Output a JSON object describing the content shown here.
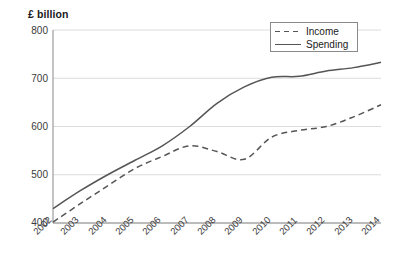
{
  "chart_data": {
    "type": "line",
    "title": "",
    "subtitle": "",
    "ylabel": "£ billion",
    "xlabel": "",
    "ylim": [
      400,
      800
    ],
    "yticks": [
      400,
      500,
      600,
      700,
      800
    ],
    "grid": true,
    "legend_position": "top-right",
    "categories": [
      "2002",
      "2003",
      "2004",
      "2005",
      "2006",
      "2007",
      "2008",
      "2009",
      "2010",
      "2011",
      "2012",
      "2013",
      "2014"
    ],
    "series": [
      {
        "name": "Income",
        "style": "dashed",
        "color": "#555555",
        "values": [
          402,
          440,
          477,
          513,
          538,
          560,
          548,
          532,
          578,
          592,
          600,
          620,
          645
        ]
      },
      {
        "name": "Spending",
        "style": "solid",
        "color": "#555555",
        "values": [
          430,
          467,
          500,
          530,
          560,
          600,
          648,
          682,
          702,
          704,
          715,
          722,
          733
        ]
      }
    ]
  },
  "axis": {
    "y_title": "£ billion",
    "y_tick_labels": [
      "800",
      "700",
      "600",
      "500",
      "400"
    ],
    "x_tick_labels": [
      "2002",
      "2003",
      "2004",
      "2005",
      "2006",
      "2007",
      "2008",
      "2009",
      "2010",
      "2011",
      "2012",
      "2013",
      "2014"
    ]
  },
  "legend": {
    "items": [
      {
        "label": "Income",
        "style": "dashed"
      },
      {
        "label": "Spending",
        "style": "solid"
      }
    ]
  },
  "colors": {
    "line": "#555555",
    "grid": "#dcdcdc",
    "axis": "#8a8a8a",
    "text": "#1a1a1a"
  }
}
